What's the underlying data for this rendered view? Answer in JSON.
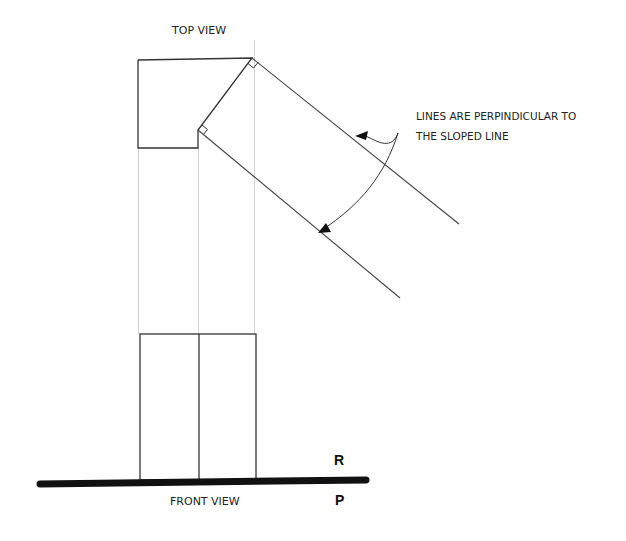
{
  "labels": {
    "top_view": "TOP VIEW",
    "front_view": "FRONT VIEW",
    "note_line1": "LINES ARE PERPINDICULAR TO",
    "note_line2": "THE SLOPED LINE",
    "plane_upper": "R",
    "plane_lower": "P"
  },
  "colors": {
    "object_line": "#333333",
    "projection_line": "#d0d0d0",
    "fold_line": "#111111"
  }
}
